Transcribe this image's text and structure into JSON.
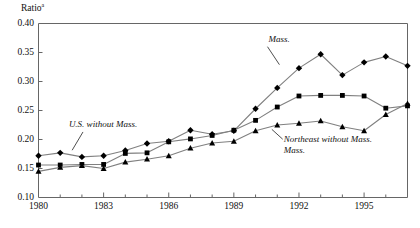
{
  "chart_data": {
    "type": "line",
    "title": "Ratio",
    "title_superscript": "a",
    "ylabel": "Ratio",
    "xlabel": "",
    "ylim": [
      0.1,
      0.4
    ],
    "xlim": [
      1980,
      1997
    ],
    "ytick_labels": [
      "0.40",
      "0.35",
      "0.30",
      "0.25",
      "0.20",
      "0.15",
      "0.10"
    ],
    "ytick_values": [
      0.4,
      0.35,
      0.3,
      0.25,
      0.2,
      0.15,
      0.1
    ],
    "xtick_labels": [
      "1980",
      "1983",
      "1986",
      "1989",
      "1992",
      "1995"
    ],
    "xtick_values": [
      1980,
      1983,
      1986,
      1989,
      1992,
      1995
    ],
    "minor_xtick_values": [
      1981,
      1982,
      1984,
      1985,
      1987,
      1988,
      1990,
      1991,
      1993,
      1994,
      1996,
      1997
    ],
    "grid": false,
    "legend_position": "inline-annotations",
    "line_color": "#808080",
    "marker_color": "#000000",
    "frame_color": "#666666",
    "x": [
      1980,
      1981,
      1982,
      1983,
      1984,
      1985,
      1986,
      1987,
      1988,
      1989,
      1990,
      1991,
      1992,
      1993,
      1994,
      1995,
      1996,
      1997
    ],
    "series": [
      {
        "name": "Mass.",
        "marker": "diamond",
        "values": [
          0.172,
          0.177,
          0.17,
          0.172,
          0.181,
          0.193,
          0.197,
          0.216,
          0.209,
          0.215,
          0.253,
          0.289,
          0.323,
          0.347,
          0.311,
          0.333,
          0.343,
          0.327
        ]
      },
      {
        "name": "U.S. without Mass.",
        "marker": "square",
        "values": [
          0.156,
          0.156,
          0.157,
          0.157,
          0.176,
          0.177,
          0.196,
          0.201,
          0.207,
          0.216,
          0.233,
          0.256,
          0.275,
          0.276,
          0.276,
          0.275,
          0.254,
          0.258
        ]
      },
      {
        "name": "Northeast without Mass.",
        "marker": "triangle",
        "values": [
          0.145,
          0.152,
          0.155,
          0.15,
          0.161,
          0.166,
          0.172,
          0.185,
          0.194,
          0.197,
          0.215,
          0.225,
          0.228,
          0.232,
          0.222,
          0.215,
          0.243,
          0.262
        ]
      }
    ],
    "annotations": [
      {
        "text": "Mass.",
        "lines": [
          "Mass."
        ],
        "x": 1990.6,
        "y": 0.368,
        "anchor": "start"
      },
      {
        "text": "U.S. without Mass.",
        "lines": [
          "U.S. without Mass."
        ],
        "x": 1981.4,
        "y": 0.222,
        "anchor": "start"
      },
      {
        "text": "Northeast without Mass.",
        "lines": [
          "Northeast without Mass.",
          "Mass."
        ],
        "x": 1991.3,
        "y": 0.196,
        "anchor": "start"
      }
    ]
  }
}
